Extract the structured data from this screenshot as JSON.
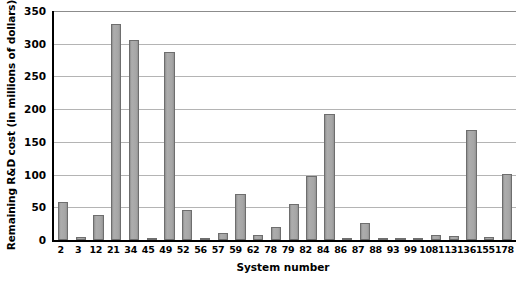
{
  "chart_data": {
    "type": "bar",
    "title": "",
    "xlabel": "System number",
    "ylabel": "Remaining R&D cost (in millions of dollars)",
    "categories": [
      "2",
      "3",
      "12",
      "21",
      "34",
      "45",
      "49",
      "52",
      "56",
      "57",
      "59",
      "62",
      "78",
      "79",
      "82",
      "84",
      "86",
      "87",
      "88",
      "93",
      "99",
      "108",
      "113",
      "136",
      "155",
      "178"
    ],
    "values": [
      58,
      5,
      38,
      330,
      306,
      2,
      288,
      46,
      2,
      11,
      71,
      7,
      20,
      55,
      98,
      193,
      0,
      26,
      2,
      2,
      0,
      8,
      6,
      168,
      5,
      101
    ],
    "ylim": [
      0,
      350
    ],
    "yticks": [
      0,
      50,
      100,
      150,
      200,
      250,
      300,
      350
    ],
    "ytick_labels": [
      "0",
      "50",
      "100",
      "150",
      "200",
      "250",
      "300",
      "350"
    ],
    "grid": true,
    "legend": false,
    "legend_position": "none",
    "colors": {
      "bar_fill": "#a3a3a3",
      "bar_stroke": "#6e6e6e",
      "gridline": "#b4b4b4",
      "axis": "#000000",
      "background": "#ffffff",
      "text": "#000000"
    }
  }
}
